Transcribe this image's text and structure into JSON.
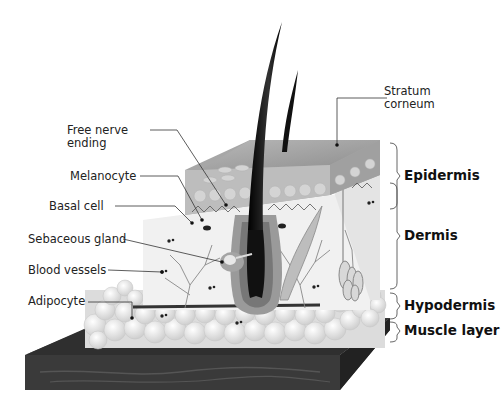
{
  "diagram": {
    "left_labels": [
      {
        "id": "free-nerve-ending",
        "text": "Free nerve\nending",
        "line1": "Free nerve",
        "line2": "ending"
      },
      {
        "id": "melanocyte",
        "text": "Melanocyte"
      },
      {
        "id": "basal-cell",
        "text": "Basal cell"
      },
      {
        "id": "sebaceous-gland",
        "text": "Sebaceous gland"
      },
      {
        "id": "blood-vessels",
        "text": "Blood vessels"
      },
      {
        "id": "adipocyte",
        "text": "Adipocyte"
      }
    ],
    "top_label": {
      "id": "stratum-corneum",
      "line1": "Stratum",
      "line2": "corneum"
    },
    "layers": [
      {
        "id": "epidermis",
        "text": "Epidermis"
      },
      {
        "id": "dermis",
        "text": "Dermis"
      },
      {
        "id": "hypodermis",
        "text": "Hypodermis"
      },
      {
        "id": "muscle-layer",
        "text": "Muscle layer"
      }
    ],
    "colors": {
      "epidermis": "#9a9a9a",
      "dermis": "#ededed",
      "hair": "#111111",
      "fat": "#e6e6e6",
      "muscle": "#2e2e2e",
      "leader": "#333333"
    }
  }
}
